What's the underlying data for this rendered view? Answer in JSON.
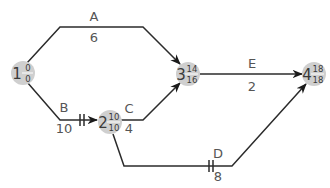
{
  "diagram": {
    "type": "activity-on-arrow network",
    "nodes": [
      {
        "id": "1",
        "earliest": "0",
        "latest": "0"
      },
      {
        "id": "2",
        "earliest": "10",
        "latest": "10"
      },
      {
        "id": "3",
        "earliest": "14",
        "latest": "16"
      },
      {
        "id": "4",
        "earliest": "18",
        "latest": "18"
      }
    ],
    "activities": [
      {
        "name": "A",
        "duration": "6",
        "from": "1",
        "to": "3",
        "critical": false
      },
      {
        "name": "B",
        "duration": "10",
        "from": "1",
        "to": "2",
        "critical": true
      },
      {
        "name": "C",
        "duration": "4",
        "from": "2",
        "to": "3",
        "critical": false
      },
      {
        "name": "D",
        "duration": "8",
        "from": "2",
        "to": "4",
        "critical": true
      },
      {
        "name": "E",
        "duration": "2",
        "from": "3",
        "to": "4",
        "critical": false
      }
    ],
    "colors": {
      "line": "#2b2b2b",
      "node_fill": "#cfcfcf",
      "label": "#555555"
    }
  }
}
